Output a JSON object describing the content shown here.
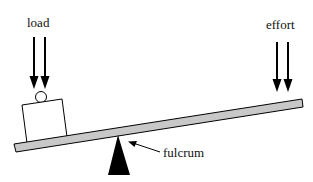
{
  "diagram": {
    "labels": {
      "load": "load",
      "effort": "effort",
      "fulcrum": "fulcrum"
    },
    "components": [
      "load-arrows",
      "load-box",
      "roller-circle",
      "lever-beam",
      "fulcrum-triangle",
      "effort-arrows",
      "fulcrum-pointer"
    ],
    "colors": {
      "beam_fill": "#c8c8c8",
      "stroke": "#000000",
      "fulcrum_fill": "#000000",
      "background": "#ffffff"
    }
  }
}
